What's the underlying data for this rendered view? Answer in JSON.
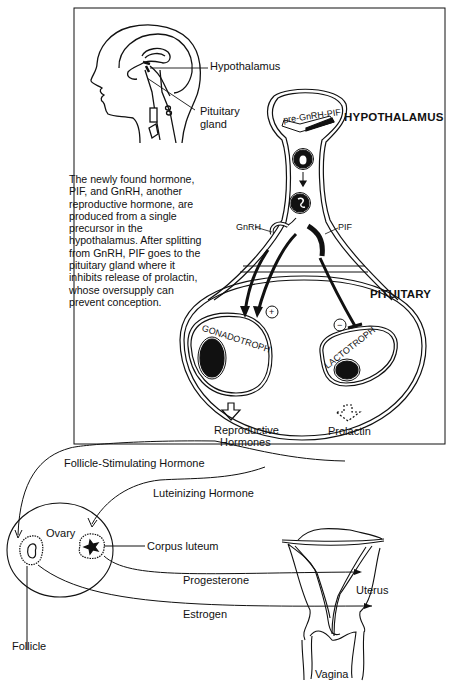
{
  "labels": {
    "hypothalamus_head": "Hypothalamus",
    "pituitary_head_1": "Pituitary",
    "pituitary_head_2": "gland",
    "hypothalamus_caps": "HYPOTHALAMUS",
    "pituitary_caps": "PITUITARY",
    "pre_gnrh_pif": "pre-GnRH-PIF",
    "gnrh": "GnRH",
    "pif": "PIF",
    "gonadotroph": "GONADOTROPH",
    "lactotroph": "LACTOTROPH",
    "plus_sign": "+",
    "minus_sign": "−",
    "reproductive_1": "Reproductive",
    "reproductive_2": "Hormones",
    "prolactin": "Prolactin",
    "fsh": "Follicle-Stimulating Hormone",
    "lh": "Luteinizing Hormone",
    "ovary": "Ovary",
    "corpus_luteum": "Corpus luteum",
    "progesterone": "Progesterone",
    "estrogen": "Estrogen",
    "follicle": "Follicle",
    "uterus": "Uterus",
    "vagina": "Vagina"
  },
  "description": "The newly found hormone, PIF, and GnRH, another reproductive hormone, are produced from a single precursor in the hypothalamus. After splitting from GnRH, PIF goes to the pituitary gland where it inhibits release of prolactin, whose oversupply can prevent conception.",
  "colors": {
    "ink": "#111111",
    "background": "#ffffff"
  }
}
